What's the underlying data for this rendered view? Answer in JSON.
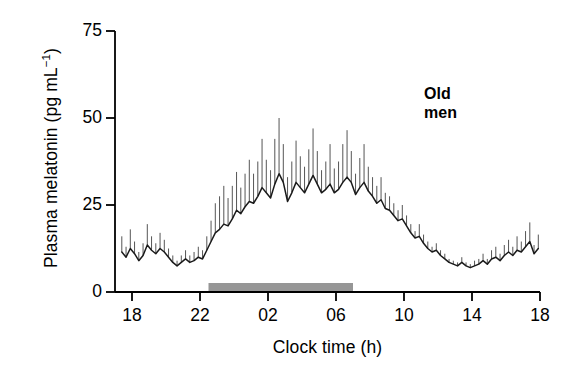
{
  "figure": {
    "annotation_label": "Old\nmen",
    "background_color": "#ffffff",
    "line_color": "#1a1a1a",
    "errorbar_color": "#555555",
    "darkbar_color": "#969696"
  },
  "chart_data": {
    "type": "line",
    "title": "",
    "subtitle": "",
    "xlabel": "Clock time (h)",
    "ylabel_text": "Plasma melatonin (pg mL",
    "ylabel_sup": "−1",
    "ylabel_tail": ")",
    "ylabel": "Plasma melatonin (pg mL⁻¹)",
    "xlim": [
      17.0,
      42.0
    ],
    "ylim": [
      0,
      75
    ],
    "grid": false,
    "legend": "none",
    "annotations": [
      {
        "text": "Old men",
        "x": 37.5,
        "y": 62,
        "bold": true
      }
    ],
    "xticks": [
      18,
      22,
      26,
      30,
      34,
      38,
      42
    ],
    "xtick_labels": [
      "18",
      "22",
      "02",
      "06",
      "10",
      "14",
      "18"
    ],
    "yticks": [
      0,
      25,
      50,
      75
    ],
    "ytick_labels": [
      "0",
      "25",
      "50",
      "75"
    ],
    "shaded_region": {
      "label": "dark period",
      "x_start": 22.5,
      "x_end": 31.0,
      "color": "#969696"
    },
    "series": [
      {
        "name": "Plasma melatonin (mean)",
        "error_type": "SEM (upper only)",
        "x": [
          17.4,
          17.65,
          17.9,
          18.15,
          18.4,
          18.65,
          18.9,
          19.15,
          19.4,
          19.65,
          19.9,
          20.15,
          20.4,
          20.65,
          20.9,
          21.15,
          21.4,
          21.65,
          21.9,
          22.15,
          22.4,
          22.65,
          22.9,
          23.15,
          23.4,
          23.65,
          23.9,
          24.15,
          24.4,
          24.65,
          24.9,
          25.15,
          25.4,
          25.65,
          25.9,
          26.15,
          26.4,
          26.65,
          26.9,
          27.15,
          27.4,
          27.65,
          27.9,
          28.15,
          28.4,
          28.65,
          28.9,
          29.15,
          29.4,
          29.65,
          29.9,
          30.15,
          30.4,
          30.65,
          30.9,
          31.15,
          31.4,
          31.65,
          31.9,
          32.15,
          32.4,
          32.65,
          32.9,
          33.15,
          33.4,
          33.65,
          33.9,
          34.15,
          34.4,
          34.65,
          34.9,
          35.15,
          35.4,
          35.65,
          35.9,
          36.15,
          36.4,
          36.65,
          36.9,
          37.15,
          37.4,
          37.65,
          37.9,
          38.15,
          38.4,
          38.65,
          38.9,
          39.15,
          39.4,
          39.65,
          39.9,
          40.15,
          40.4,
          40.65,
          40.9,
          41.15,
          41.4,
          41.65,
          41.9
        ],
        "y": [
          11.5,
          10.0,
          12.5,
          11.0,
          9.0,
          10.5,
          13.5,
          12.0,
          11.0,
          12.5,
          11.5,
          10.0,
          8.5,
          7.5,
          8.5,
          9.5,
          8.5,
          9.0,
          10.0,
          9.5,
          12.0,
          14.5,
          17.0,
          18.0,
          19.5,
          19.0,
          21.0,
          23.5,
          22.5,
          24.5,
          26.0,
          25.5,
          27.5,
          30.0,
          28.5,
          27.0,
          31.0,
          34.0,
          31.5,
          26.0,
          28.5,
          31.5,
          30.0,
          28.5,
          31.0,
          33.5,
          31.0,
          28.5,
          29.5,
          31.0,
          28.5,
          29.5,
          31.5,
          33.0,
          31.5,
          28.0,
          30.0,
          31.5,
          29.0,
          27.5,
          25.5,
          26.5,
          24.0,
          23.5,
          22.0,
          20.5,
          21.0,
          19.0,
          17.0,
          15.5,
          16.0,
          14.0,
          12.5,
          11.5,
          12.0,
          10.5,
          9.5,
          8.5,
          8.0,
          7.5,
          8.5,
          7.5,
          7.0,
          7.5,
          8.0,
          9.0,
          8.0,
          9.5,
          10.0,
          9.0,
          10.5,
          11.5,
          10.5,
          12.0,
          11.5,
          13.0,
          14.5,
          11.0,
          12.5
        ],
        "yerr_upper": [
          4.5,
          3.0,
          5.5,
          3.5,
          2.5,
          3.5,
          6.0,
          4.0,
          3.0,
          4.5,
          3.5,
          2.5,
          2.0,
          1.5,
          2.0,
          2.5,
          2.0,
          2.5,
          3.0,
          2.5,
          4.0,
          6.0,
          8.5,
          9.5,
          11.0,
          8.0,
          9.5,
          11.0,
          7.5,
          9.5,
          12.0,
          8.5,
          10.0,
          14.0,
          9.5,
          8.0,
          13.0,
          16.0,
          11.0,
          7.0,
          9.0,
          12.0,
          9.0,
          7.5,
          10.0,
          13.5,
          9.5,
          6.5,
          8.0,
          11.5,
          7.0,
          8.0,
          11.0,
          13.5,
          9.0,
          6.0,
          8.5,
          11.0,
          7.0,
          5.5,
          5.0,
          6.5,
          4.5,
          4.0,
          3.5,
          3.0,
          4.0,
          3.0,
          2.5,
          2.0,
          3.5,
          2.5,
          2.0,
          1.5,
          2.0,
          1.5,
          1.5,
          1.0,
          1.0,
          1.0,
          1.5,
          1.0,
          1.0,
          1.5,
          1.5,
          2.0,
          1.5,
          2.5,
          3.0,
          2.0,
          3.0,
          3.5,
          2.5,
          4.0,
          3.0,
          4.5,
          5.5,
          2.5,
          4.0
        ]
      }
    ]
  }
}
